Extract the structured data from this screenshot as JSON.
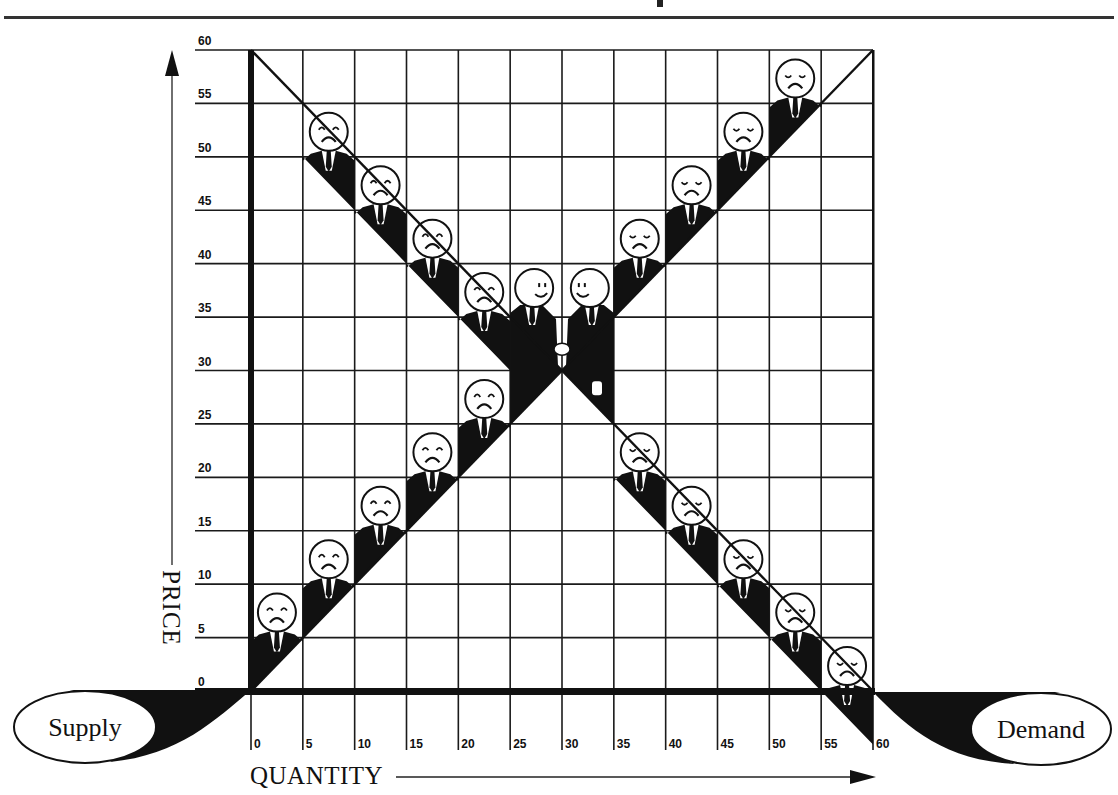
{
  "title_rule_visible": true,
  "axes": {
    "x_label": "QUANTITY",
    "y_label": "PRICE",
    "x_ticks": [
      "0",
      "5",
      "10",
      "15",
      "20",
      "25",
      "30",
      "35",
      "40",
      "45",
      "50",
      "55",
      "60"
    ],
    "y_ticks": [
      "0",
      "5",
      "10",
      "15",
      "20",
      "25",
      "30",
      "35",
      "40",
      "45",
      "50",
      "55",
      "60"
    ]
  },
  "labels": {
    "supply": "Supply",
    "demand": "Demand"
  },
  "colors": {
    "ink": "#111111",
    "paper": "#ffffff",
    "grid": "#1a1a1a"
  },
  "chart_data": {
    "type": "line",
    "title": "",
    "xlabel": "QUANTITY",
    "ylabel": "PRICE",
    "xlim": [
      0,
      60
    ],
    "ylim": [
      0,
      60
    ],
    "grid": true,
    "series": [
      {
        "name": "Supply",
        "x": [
          0,
          60
        ],
        "y": [
          0,
          60
        ],
        "figures": "unhappy sellers at quantities 0-25 (prices 5-30)"
      },
      {
        "name": "Demand",
        "x": [
          0,
          60
        ],
        "y": [
          60,
          0
        ],
        "figures": "unhappy buyers at quantities 5-20 and 35-55"
      }
    ],
    "equilibrium": {
      "quantity": 30,
      "price": 30,
      "annotation": "two smiling figures shaking hands"
    },
    "supply_figures": [
      {
        "q": 0,
        "mood": "sad"
      },
      {
        "q": 5,
        "mood": "sad"
      },
      {
        "q": 10,
        "mood": "sad"
      },
      {
        "q": 15,
        "mood": "sad"
      },
      {
        "q": 20,
        "mood": "sad"
      }
    ],
    "demand_upper_figures": [
      {
        "q": 5,
        "mood": "sad"
      },
      {
        "q": 10,
        "mood": "sad"
      },
      {
        "q": 15,
        "mood": "sad"
      },
      {
        "q": 20,
        "mood": "sad"
      }
    ],
    "supply_upper_figures": [
      {
        "q": 35,
        "mood": "sad"
      },
      {
        "q": 40,
        "mood": "sad"
      },
      {
        "q": 45,
        "mood": "sad"
      },
      {
        "q": 50,
        "mood": "sad"
      }
    ],
    "demand_lower_figures": [
      {
        "q": 35,
        "mood": "sad"
      },
      {
        "q": 40,
        "mood": "sad"
      },
      {
        "q": 45,
        "mood": "sad"
      },
      {
        "q": 50,
        "mood": "sad"
      },
      {
        "q": 55,
        "mood": "sad"
      }
    ]
  }
}
